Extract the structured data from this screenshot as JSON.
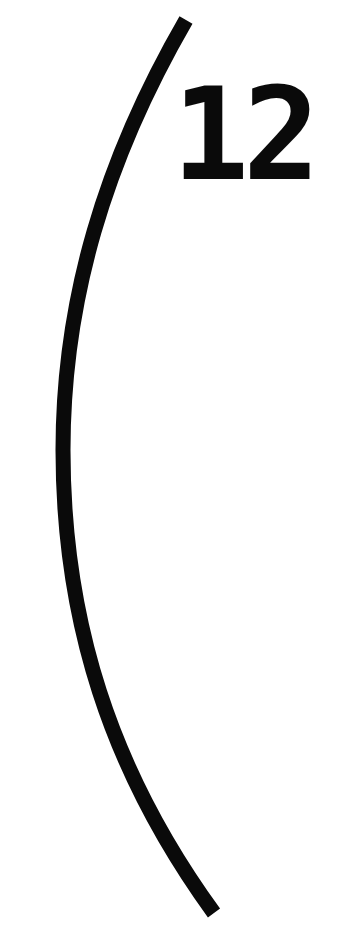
{
  "figure": {
    "label": "12",
    "stroke_color": "#0a0a0a",
    "background_color": "#ffffff",
    "arc": {
      "shape": "left-opening parenthesis curve",
      "top_point": [
        186,
        20
      ],
      "leftmost_point": [
        63,
        450
      ],
      "bottom_point": [
        214,
        913
      ],
      "stroke_width": 15
    }
  }
}
